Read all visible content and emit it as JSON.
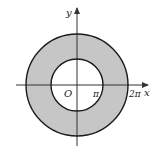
{
  "diagram": {
    "type": "annulus",
    "colors": {
      "fill": "#c6c6c6",
      "stroke": "#1a1a1a",
      "axis": "#333333",
      "background": "#ffffff"
    },
    "labels": {
      "x_axis": "x",
      "y_axis": "y",
      "origin": "O",
      "inner_radius": "π",
      "outer_radius": "2π"
    },
    "inner_radius_value": "π",
    "outer_radius_value": "2π"
  }
}
